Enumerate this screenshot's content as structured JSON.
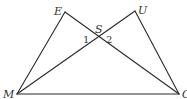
{
  "diagram": {
    "points": {
      "E": {
        "label": "E",
        "x": 65,
        "y": 12
      },
      "U": {
        "label": "U",
        "x": 135,
        "y": 11
      },
      "M": {
        "label": "M",
        "x": 17,
        "y": 94
      },
      "O": {
        "label": "O",
        "x": 179,
        "y": 94
      },
      "S": {
        "label": "S",
        "x": 98,
        "y": 38
      }
    },
    "segments": [
      [
        "M",
        "E"
      ],
      [
        "E",
        "O"
      ],
      [
        "M",
        "U"
      ],
      [
        "U",
        "O"
      ],
      [
        "M",
        "O"
      ]
    ],
    "angle_labels": {
      "angle1": "1",
      "angle2": "2"
    },
    "colors": {
      "line": "#2a2a2a",
      "text": "#333333",
      "background": "#ffffff"
    }
  }
}
